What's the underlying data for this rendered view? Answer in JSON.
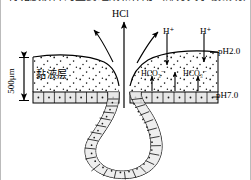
{
  "figure": {
    "kind": "biology-diagram",
    "truncated_caption_above": "胃黏膜屏障的主要组成和作用（部分文字被裁切）",
    "labels": {
      "hcl": "HCl",
      "h_ion_left": "H⁺",
      "h_ion_right": "H⁺",
      "bicarbonate_left": "HCO₃⁻",
      "bicarbonate_right": "HCO₃⁻",
      "ph_lumen": "pH2.0",
      "ph_epithelium": "pH7.0",
      "mucus_layer": "黏液层",
      "scale_bar": "500μm"
    },
    "colors": {
      "ink": "#000000",
      "cell_fill": "#e8e8e8",
      "mucus_fill": "#ffffff",
      "stipple": "#1a1a1a",
      "border": "#b9b9b9"
    }
  }
}
